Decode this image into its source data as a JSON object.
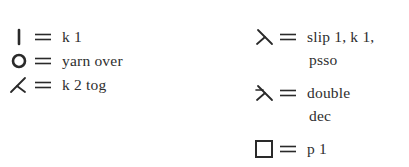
{
  "legend": {
    "left_column": [
      {
        "symbol": "vertical-bar",
        "label": "k 1"
      },
      {
        "symbol": "circle",
        "label": "yarn over"
      },
      {
        "symbol": "right-slant-decrease",
        "label": "k 2 tog"
      }
    ],
    "right_column": [
      {
        "symbol": "left-slant-decrease",
        "label": "slip 1, k 1,",
        "continuation": "psso"
      },
      {
        "symbol": "double-decrease",
        "label": "double",
        "continuation": "dec"
      },
      {
        "symbol": "square",
        "label": "p 1"
      }
    ],
    "equals_sign": "="
  }
}
